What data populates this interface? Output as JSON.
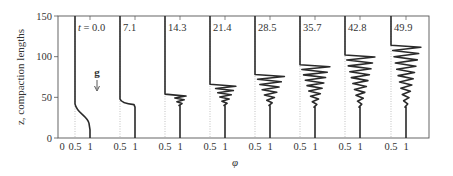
{
  "chart_data": {
    "type": "line",
    "title": "",
    "xlabel": "φ",
    "ylabel": "z, compaction lengths",
    "ylim": [
      0,
      150
    ],
    "yticks": [
      0,
      50,
      100,
      150
    ],
    "panel_xticks": [
      "0.5",
      "1"
    ],
    "first_panel_extra_tick": "0",
    "grid": false,
    "gravity_label": "g",
    "panels": [
      {
        "t_label": "t = 0.0",
        "t": 0.0,
        "front_z": 40,
        "amplitude": 0,
        "wave_top": 40,
        "wave_bottom": 0,
        "n_osc": 0
      },
      {
        "t_label": "7.1",
        "t": 7.1,
        "front_z": 40,
        "amplitude": 0,
        "wave_top": 46,
        "wave_bottom": 38,
        "n_osc": 0
      },
      {
        "t_label": "14.3",
        "t": 14.3,
        "front_z": 54,
        "amplitude": 0.25,
        "wave_top": 54,
        "wave_bottom": 40,
        "n_osc": 2
      },
      {
        "t_label": "21.4",
        "t": 21.4,
        "front_z": 66,
        "amplitude": 0.45,
        "wave_top": 66,
        "wave_bottom": 40,
        "n_osc": 4
      },
      {
        "t_label": "28.5",
        "t": 28.5,
        "front_z": 78,
        "amplitude": 0.6,
        "wave_top": 78,
        "wave_bottom": 40,
        "n_osc": 5
      },
      {
        "t_label": "35.7",
        "t": 35.7,
        "front_z": 90,
        "amplitude": 0.62,
        "wave_top": 90,
        "wave_bottom": 38,
        "n_osc": 7
      },
      {
        "t_label": "42.8",
        "t": 42.8,
        "front_z": 102,
        "amplitude": 0.62,
        "wave_top": 102,
        "wave_bottom": 38,
        "n_osc": 8
      },
      {
        "t_label": "49.9",
        "t": 49.9,
        "front_z": 114,
        "amplitude": 0.62,
        "wave_top": 114,
        "wave_bottom": 38,
        "n_osc": 9
      }
    ]
  }
}
